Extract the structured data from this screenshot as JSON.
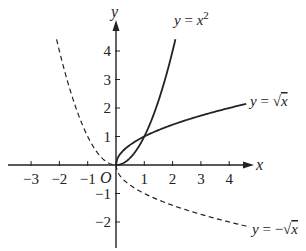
{
  "chart_data": {
    "type": "line",
    "title": "",
    "xlabel": "x",
    "ylabel": "y",
    "origin_label": "O",
    "xlim": [
      -3.5,
      4.8
    ],
    "ylim": [
      -2.6,
      5.1
    ],
    "grid": false,
    "x_ticks": [
      -3,
      -2,
      -1,
      1,
      2,
      3,
      4
    ],
    "x_tick_labels": [
      "−3",
      "−2",
      "−1",
      "1",
      "2",
      "3",
      "4"
    ],
    "y_ticks": [
      -2,
      -1,
      1,
      2,
      3,
      4
    ],
    "y_tick_labels": [
      "−2",
      "−1",
      "1",
      "2",
      "3",
      "4"
    ],
    "series": [
      {
        "name": "y = x^2",
        "label": "y = x²",
        "style": "solid",
        "domain": [
          0,
          2.1
        ],
        "function": "x^2"
      },
      {
        "name": "y = x^2 (x<0 branch)",
        "label": "",
        "style": "dashed",
        "domain": [
          -2.1,
          0
        ],
        "function": "x^2"
      },
      {
        "name": "y = sqrt(x)",
        "label": "y = √x",
        "style": "solid",
        "domain": [
          0,
          4.6
        ],
        "function": "sqrt(x)"
      },
      {
        "name": "y = -sqrt(x)",
        "label": "y = −√x",
        "style": "dashed",
        "domain": [
          0,
          4.7
        ],
        "function": "-sqrt(x)"
      }
    ],
    "intersections": [
      [
        0,
        0
      ],
      [
        1,
        1
      ]
    ]
  },
  "labels": {
    "x_axis": "x",
    "y_axis": "y",
    "origin": "O",
    "parabola": {
      "y": "y",
      "eq": " = ",
      "x": "x",
      "exp": "2"
    },
    "sqrt": {
      "y": "y",
      "eq": " = ",
      "rad": "√",
      "x": "x"
    },
    "neg_sqrt": {
      "y": "y",
      "eq": " = −",
      "rad": "√",
      "x": "x"
    }
  },
  "colors": {
    "ink": "#222222",
    "background": "#ffffff"
  }
}
